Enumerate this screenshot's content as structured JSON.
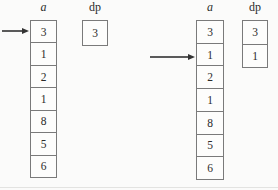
{
  "diagram": {
    "line_color": "#7a7a7a",
    "ink_color": "#2b2b2b",
    "panels": [
      {
        "array_label": "a",
        "dp_label": "dp",
        "cells": [
          "3",
          "1",
          "2",
          "1",
          "8",
          "5",
          "6"
        ],
        "arrow_cell_index": 0,
        "dp_cells": [
          "3"
        ]
      },
      {
        "array_label": "a",
        "dp_label": "dp",
        "cells": [
          "3",
          "1",
          "2",
          "1",
          "8",
          "5",
          "6"
        ],
        "arrow_cell_index": 1,
        "dp_cells": [
          "3",
          "1"
        ]
      }
    ]
  }
}
